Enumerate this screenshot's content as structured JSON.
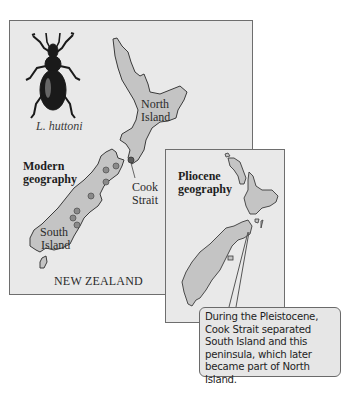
{
  "main_map": {
    "species_label": "L. huttoni",
    "title_line1": "Modern",
    "title_line2": "geography",
    "north_island_line1": "North",
    "north_island_line2": "Island",
    "south_island_line1": "South",
    "south_island_line2": "Island",
    "strait_line1": "Cook",
    "strait_line2": "Strait",
    "country_label": "NEW ZEALAND",
    "dot_count": 7
  },
  "inset_map": {
    "title_line1": "Pliocene",
    "title_line2": "geography"
  },
  "callout": {
    "text": "During the Pleistocene, Cook Strait separated South Island and this peninsula, which later became part of North Island."
  },
  "colors": {
    "panel_bg": "#e9e9e9",
    "land_fill": "#c4c4c4",
    "outline": "#3a3a3a",
    "dot_fill": "#8a8a8a"
  }
}
